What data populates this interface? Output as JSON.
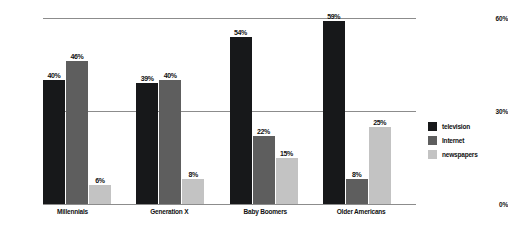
{
  "chart_data": {
    "type": "bar",
    "title": "",
    "subtitle": "",
    "xlabel": "",
    "ylabel": "",
    "ylim": [
      0,
      60
    ],
    "yticks": [
      "0%",
      "30%",
      "60%"
    ],
    "grid": true,
    "legend_position": "right",
    "categories": [
      "Millennials",
      "Generation X",
      "Baby Boomers",
      "Older Americans"
    ],
    "series": [
      {
        "name": "television",
        "color": "#17181a",
        "values": [
          40,
          39,
          54,
          59
        ],
        "labels": [
          "40%",
          "39%",
          "54%",
          "59%"
        ]
      },
      {
        "name": "Internet",
        "color": "#5e5e5e",
        "values": [
          46,
          40,
          22,
          8
        ],
        "labels": [
          "46%",
          "40%",
          "22%",
          "8%"
        ]
      },
      {
        "name": "newspapers",
        "color": "#c3c3c3",
        "values": [
          6,
          8,
          15,
          25
        ],
        "labels": [
          "6%",
          "8%",
          "15%",
          "25%"
        ]
      }
    ]
  }
}
